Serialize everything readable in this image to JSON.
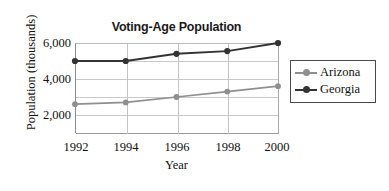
{
  "chart_data": {
    "type": "line",
    "title": "Voting-Age Population",
    "xlabel": "Year",
    "ylabel": "Population (thousands)",
    "x": [
      1992,
      1994,
      1996,
      1998,
      2000
    ],
    "xtick_labels": [
      "1992",
      "1994",
      "1996",
      "1998",
      "2000"
    ],
    "ytick_labels": [
      "2,000",
      "4,000",
      "6,000"
    ],
    "ytick_values": [
      2000,
      4000,
      6000
    ],
    "ylim": [
      1000,
      6000
    ],
    "xlim": [
      1992,
      2000
    ],
    "grid": "horizontal-and-vertical",
    "legend_position": "right",
    "series": [
      {
        "name": "Arizona",
        "color": "#8f8f8f",
        "marker": "circle",
        "values": [
          2600,
          2700,
          3000,
          3300,
          3600
        ]
      },
      {
        "name": "Georgia",
        "color": "#333333",
        "marker": "circle",
        "values": [
          5000,
          5000,
          5400,
          5550,
          6000
        ]
      }
    ]
  },
  "legend": {
    "items": [
      {
        "label": "Arizona"
      },
      {
        "label": "Georgia"
      }
    ]
  }
}
